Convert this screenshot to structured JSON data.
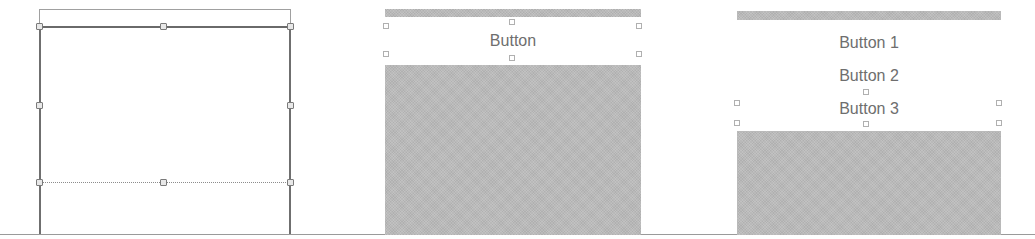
{
  "figure": {
    "panels": [
      {
        "id": "panel-1",
        "description": "empty stack view selected with resize handles",
        "buttons": []
      },
      {
        "id": "panel-2",
        "description": "stack view containing one button",
        "buttons": [
          {
            "label": "Button"
          }
        ]
      },
      {
        "id": "panel-3",
        "description": "stack view containing three buttons",
        "buttons": [
          {
            "label": "Button 1"
          },
          {
            "label": "Button 2"
          },
          {
            "label": "Button 3"
          }
        ]
      }
    ],
    "colors": {
      "background": "#ffffff",
      "gray_fill": "#b9b9b9",
      "outline": "#6f6f6f",
      "text": "#6e6e6e"
    }
  }
}
